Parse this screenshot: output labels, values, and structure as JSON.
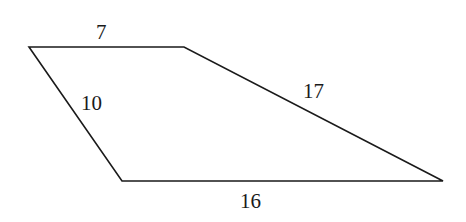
{
  "diagram": {
    "type": "trapezoid",
    "vertices": {
      "top_left": [
        29,
        47
      ],
      "top_right": [
        184,
        47
      ],
      "bottom_right": [
        443,
        181
      ],
      "bottom_left": [
        122,
        181
      ]
    },
    "stroke_color": "#1a1a1a",
    "sides": [
      {
        "name": "top",
        "label": "7"
      },
      {
        "name": "left",
        "label": "10"
      },
      {
        "name": "right",
        "label": "17"
      },
      {
        "name": "bottom",
        "label": "16"
      }
    ]
  }
}
